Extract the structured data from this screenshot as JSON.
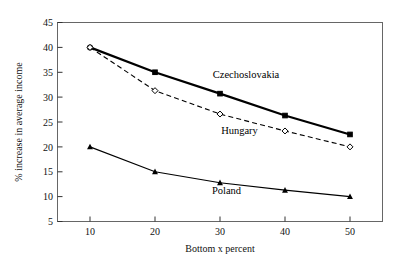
{
  "chart_data": {
    "type": "line",
    "title": "",
    "xlabel": "Bottom x percent",
    "ylabel": "% increase in average income",
    "x": [
      10,
      20,
      30,
      40,
      50
    ],
    "xticks": [
      "10",
      "20",
      "30",
      "40",
      "50"
    ],
    "yticks": [
      "5",
      "10",
      "15",
      "20",
      "25",
      "30",
      "35",
      "40",
      "45"
    ],
    "xlim": [
      5,
      55
    ],
    "ylim": [
      5,
      45
    ],
    "grid": false,
    "legend_position": "inline-annotations",
    "series": [
      {
        "name": "Czechoslovakia",
        "values": [
          40.0,
          35.0,
          30.7,
          26.3,
          22.5
        ],
        "line_style": "solid",
        "line_width": 2.2,
        "marker": "filled-square",
        "color": "#000000",
        "label_x": 34,
        "label_y": 33.8
      },
      {
        "name": "Hungary",
        "values": [
          40.0,
          31.3,
          26.6,
          23.2,
          20.0
        ],
        "line_style": "dashed",
        "line_width": 1.1,
        "marker": "open-diamond",
        "color": "#000000",
        "label_x": 33,
        "label_y": 22.6
      },
      {
        "name": "Poland",
        "values": [
          20.0,
          15.0,
          12.8,
          11.3,
          10.0
        ],
        "line_style": "solid",
        "line_width": 1.1,
        "marker": "filled-triangle",
        "color": "#000000",
        "label_x": 31,
        "label_y": 10.6
      }
    ]
  },
  "axes": {
    "y_label": "% increase in average income",
    "x_label": "Bottom x percent",
    "frame_color": "#555555"
  },
  "labels": {
    "czechoslovakia": "Czechoslovakia",
    "hungary": "Hungary",
    "poland": "Poland"
  },
  "yticks": {
    "t0": "5",
    "t1": "10",
    "t2": "15",
    "t3": "20",
    "t4": "25",
    "t5": "30",
    "t6": "35",
    "t7": "40",
    "t8": "45"
  },
  "xticks": {
    "t0": "10",
    "t1": "20",
    "t2": "30",
    "t3": "40",
    "t4": "50"
  }
}
